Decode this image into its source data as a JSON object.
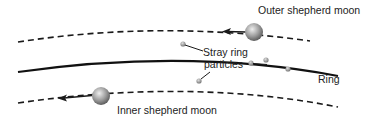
{
  "labels": {
    "outer_moon": "Outer shepherd moon",
    "stray_line1": "Stray ring",
    "stray_line2": "particles",
    "ring": "Ring",
    "inner_moon": "Inner shepherd moon"
  },
  "colors": {
    "line": "#1a1a1a",
    "moon_light": "#e0e0e0",
    "moon_dark": "#6a6a6a",
    "particle": "#9a9a9a"
  }
}
